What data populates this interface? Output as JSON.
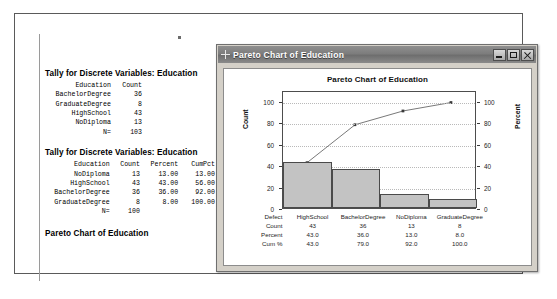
{
  "session": {
    "tally1": {
      "title": "Tally for Discrete Variables: Education",
      "headers": [
        "Education",
        "Count"
      ],
      "rows": [
        [
          "BachelorDegree",
          "36"
        ],
        [
          "GraduateDegree",
          "8"
        ],
        [
          "HighSchool",
          "43"
        ],
        [
          "NoDiploma",
          "13"
        ],
        [
          "N=",
          "103"
        ]
      ]
    },
    "tally2": {
      "title": "Tally for Discrete Variables: Education",
      "headers": [
        "Education",
        "Count",
        "Percent",
        "CumPct"
      ],
      "rows": [
        [
          "NoDiploma",
          "13",
          "13.00",
          "13.00"
        ],
        [
          "HighSchool",
          "43",
          "43.00",
          "56.00"
        ],
        [
          "BachelorDegree",
          "36",
          "36.00",
          "92.00"
        ],
        [
          "GraduateDegree",
          "8",
          "8.00",
          "100.00"
        ],
        [
          "N=",
          "100",
          "",
          ""
        ]
      ]
    },
    "pareto_heading": "Pareto Chart of Education"
  },
  "graph_window": {
    "title": "Pareto Chart of Education",
    "icon": "crosshair-icon",
    "buttons": {
      "minimize": "minimize-button",
      "maximize": "maximize-button",
      "close": "close-button"
    }
  },
  "chart_data": {
    "type": "bar",
    "title": "Pareto Chart of Education",
    "categories": [
      "HighSchool",
      "BachelorDegree",
      "NoDiploma",
      "GraduateDegree"
    ],
    "values": [
      43,
      36,
      13,
      8
    ],
    "series": [
      {
        "name": "Count",
        "values": [
          43,
          36,
          13,
          8
        ]
      },
      {
        "name": "Cum %",
        "values": [
          43.0,
          79.0,
          92.0,
          100.0
        ]
      }
    ],
    "xlabel": "",
    "ylabel": "Count",
    "y2label": "Percent",
    "ylim": [
      0,
      110
    ],
    "y2lim": [
      0,
      110
    ],
    "yticks": [
      0,
      20,
      40,
      60,
      80,
      100
    ],
    "y2ticks": [
      0,
      20,
      40,
      60,
      80,
      100
    ],
    "grid": true,
    "legend": "none",
    "table": {
      "row_labels": [
        "Defect",
        "Count",
        "Percent",
        "Cum %"
      ],
      "rows": [
        [
          "HighSchool",
          "BachelorDegree",
          "NoDiploma",
          "GraduateDegree"
        ],
        [
          "43",
          "36",
          "13",
          "8"
        ],
        [
          "43.0",
          "36.0",
          "13.0",
          "8.0"
        ],
        [
          "43.0",
          "79.0",
          "92.0",
          "100.0"
        ]
      ]
    }
  },
  "colors": {
    "bar_fill": "#c3c3c3",
    "bar_edge": "#4a4a4a",
    "line": "#555555",
    "window_chrome": "#d4d0c8",
    "titlebar": "#7d7d7d"
  }
}
